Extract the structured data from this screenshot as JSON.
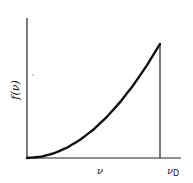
{
  "chart_data": {
    "type": "line",
    "title": "",
    "xlabel": "ν",
    "ylabel": "f(ν)",
    "x_tick_labels": [
      {
        "label": "ν",
        "sub": "",
        "position": "mid"
      },
      {
        "label": "ν",
        "sub": "D",
        "position": "cutoff"
      }
    ],
    "series": [
      {
        "name": "f(ν)",
        "description": "Monotonically increasing convex curve (∝ ν²) from the origin up to the cutoff frequency ν_D, then dropping vertically to zero",
        "x": [
          0,
          0.1,
          0.2,
          0.3,
          0.4,
          0.5,
          0.6,
          0.7,
          0.8,
          0.9,
          1.0
        ],
        "values": [
          0,
          0.01,
          0.04,
          0.09,
          0.16,
          0.25,
          0.36,
          0.49,
          0.64,
          0.81,
          1.0
        ]
      }
    ],
    "cutoff": {
      "x": 1.0,
      "label": "ν_D",
      "drop_to_zero": true
    },
    "grid": false,
    "legend": "none",
    "xlim": [
      0,
      1.15
    ],
    "ylim": [
      0,
      1.23
    ]
  },
  "labels": {
    "y_axis": "f(ν)",
    "x_mid": "ν",
    "x_cutoff_main": "ν",
    "x_cutoff_sub": "D"
  },
  "colors": {
    "axis": "#222222",
    "curve": "#111111",
    "background": "#ffffff",
    "dot": "#bbbbbb"
  }
}
